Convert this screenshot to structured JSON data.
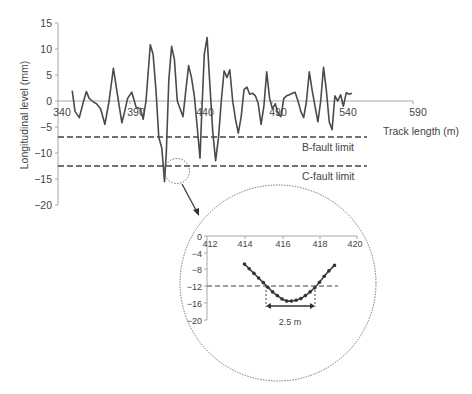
{
  "chart_data": [
    {
      "type": "line",
      "title": "",
      "xlabel": "Track length (m)",
      "ylabel": "Longitudinal level (mm)",
      "xlim": [
        340,
        590
      ],
      "ylim": [
        -20,
        15
      ],
      "x_ticks": [
        "340",
        "390",
        "440",
        "490",
        "540",
        "590"
      ],
      "y_ticks": [
        "15",
        "10",
        "5",
        "0",
        "-5",
        "-10",
        "-15",
        "-20"
      ],
      "grid": false,
      "series": [
        {
          "name": "Longitudinal level",
          "x": [
            350,
            352,
            355,
            358,
            360,
            362,
            365,
            367,
            370,
            373,
            376,
            379,
            382,
            385,
            387,
            389,
            392,
            395,
            398,
            400,
            402,
            405,
            407,
            409,
            411,
            413,
            414,
            415,
            416.3,
            418,
            420,
            422,
            424,
            426,
            428,
            430,
            432,
            434,
            436,
            438,
            440,
            441,
            443,
            445,
            447,
            449,
            451,
            453,
            455,
            457,
            459,
            461,
            463,
            465,
            467,
            469,
            471,
            473,
            475,
            477,
            479,
            481,
            483,
            485,
            487,
            489,
            491,
            493,
            495,
            497,
            499,
            501,
            503,
            505,
            507,
            509,
            511,
            513,
            515,
            517,
            519,
            521,
            523,
            525,
            527,
            529,
            531,
            533,
            535,
            537,
            539,
            541,
            543,
            545,
            547
          ],
          "y": [
            2,
            -2,
            -3.2,
            0,
            1.8,
            0.5,
            -0.2,
            -0.5,
            -1.5,
            -4.5,
            0,
            6.3,
            1,
            -4.2,
            -2,
            0.5,
            1.7,
            -1.2,
            -1.5,
            -3.5,
            0,
            10.8,
            9,
            2,
            -7,
            -9,
            -12,
            -15.5,
            -10,
            4,
            10.5,
            8,
            0,
            -1.5,
            -3,
            2,
            6.8,
            4.5,
            1,
            -5,
            -11,
            -4,
            9,
            12.2,
            3,
            -6,
            -11.5,
            -7,
            0,
            5.8,
            4.5,
            6,
            0,
            -3.5,
            -6.2,
            -3,
            2.2,
            2.7,
            1.3,
            1.5,
            1,
            -0.5,
            -4.5,
            -1,
            5.6,
            0.5,
            -1.5,
            -0.5,
            -2.5,
            -3,
            0.5,
            1,
            1.2,
            1.5,
            1.7,
            0,
            -2,
            -3.2,
            0,
            5.6,
            2,
            -1,
            -4,
            0,
            6.5,
            2,
            -4,
            -5.5,
            1,
            0,
            1.2,
            -1,
            1.6,
            1.3,
            1.5
          ]
        }
      ],
      "reference_lines": [
        {
          "label": "B-fault limit",
          "y": -7,
          "style": "dashed"
        },
        {
          "label": "C-fault limit",
          "y": -12.5,
          "style": "dashed"
        }
      ],
      "annotations": [
        {
          "type": "dotted-circle",
          "at_x": 416,
          "at_y": -14,
          "note": "zoomed region"
        }
      ]
    },
    {
      "type": "line",
      "title": "inset (zoom of dip)",
      "xlabel": "",
      "ylabel": "",
      "xlim": [
        412,
        420
      ],
      "ylim": [
        -20,
        0
      ],
      "x_ticks": [
        "412",
        "414",
        "416",
        "418",
        "420"
      ],
      "y_ticks": [
        "0",
        "-4",
        "-8",
        "-12",
        "-16",
        "-20"
      ],
      "grid": false,
      "series": [
        {
          "name": "Longitudinal level (detail)",
          "markers": true,
          "x": [
            414.0,
            414.25,
            414.5,
            414.75,
            415.0,
            415.25,
            415.5,
            415.75,
            416.0,
            416.25,
            416.5,
            416.75,
            417.0,
            417.25,
            417.5,
            417.75,
            418.0,
            418.25,
            418.5,
            418.8
          ],
          "y": [
            -6.7,
            -7.8,
            -8.9,
            -10.0,
            -11.1,
            -12.2,
            -13.3,
            -14.2,
            -15.0,
            -15.5,
            -15.5,
            -15.3,
            -14.9,
            -14.2,
            -13.3,
            -12.3,
            -11.0,
            -9.6,
            -8.3,
            -7.0
          ]
        }
      ],
      "reference_lines": [
        {
          "label": "C-fault limit",
          "y": -12,
          "style": "dashed"
        }
      ],
      "annotations": [
        {
          "type": "dimension",
          "from_x": 415.2,
          "to_x": 417.8,
          "label": "2.5 m"
        }
      ]
    }
  ],
  "labels": {
    "ylabel": "Longitudinal level (mm)",
    "xlabel": "Track length (m)",
    "b_fault": "B-fault limit",
    "c_fault": "C-fault limit",
    "span": "2.5 m",
    "x_ticks": [
      "340",
      "390",
      "440",
      "490",
      "540",
      "590"
    ],
    "y_ticks": [
      "15",
      "10",
      "5",
      "0",
      "−5",
      "−10",
      "−15",
      "−20"
    ],
    "inset_x_ticks": [
      "412",
      "414",
      "416",
      "418",
      "420"
    ],
    "inset_y_ticks": [
      "0",
      "−4",
      "−8",
      "−12",
      "−16",
      "−20"
    ]
  },
  "colors": {
    "line": "#4a4a4a",
    "axis": "#a8a8a8",
    "dashed": "#444444",
    "text": "#444444"
  }
}
